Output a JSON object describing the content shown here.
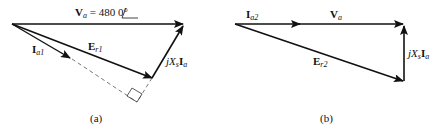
{
  "diagram": {
    "type": "phasor-diagram",
    "panels": [
      {
        "id": "a",
        "caption": "(a)",
        "labels": {
          "va_main": "V",
          "va_sub": "a",
          "va_value": " = 480 ",
          "va_angle": "0°",
          "ia_main": "I",
          "ia_sub": "a1",
          "er_main": "E",
          "er_sub": "r1",
          "jx_j": "jX",
          "jx_sub": "s",
          "jx_i": "I",
          "jx_isub": "a"
        }
      },
      {
        "id": "b",
        "caption": "(b)",
        "labels": {
          "ia_main": "I",
          "ia_sub": "a2",
          "va_main": "V",
          "va_sub": "a",
          "er_main": "E",
          "er_sub": "r2",
          "jx_j": "jX",
          "jx_sub": "s",
          "jx_i": "I",
          "jx_isub": "a"
        }
      }
    ],
    "colors": {
      "stroke": "#111111",
      "background": "#ffffff"
    }
  }
}
